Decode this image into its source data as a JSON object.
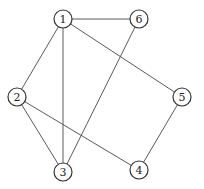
{
  "graph": {
    "type": "undirected",
    "nodes": [
      {
        "id": "1",
        "label": "1"
      },
      {
        "id": "2",
        "label": "2"
      },
      {
        "id": "3",
        "label": "3"
      },
      {
        "id": "4",
        "label": "4"
      },
      {
        "id": "5",
        "label": "5"
      },
      {
        "id": "6",
        "label": "6"
      }
    ],
    "edges": [
      {
        "from": "1",
        "to": "6"
      },
      {
        "from": "1",
        "to": "2"
      },
      {
        "from": "1",
        "to": "3"
      },
      {
        "from": "1",
        "to": "5"
      },
      {
        "from": "2",
        "to": "3"
      },
      {
        "from": "2",
        "to": "4"
      },
      {
        "from": "3",
        "to": "6"
      },
      {
        "from": "4",
        "to": "5"
      }
    ],
    "colors": {
      "edge": "#5a5a5a",
      "node_stroke": "#333333",
      "node_fill": "#ffffff",
      "label": "#222222"
    }
  }
}
